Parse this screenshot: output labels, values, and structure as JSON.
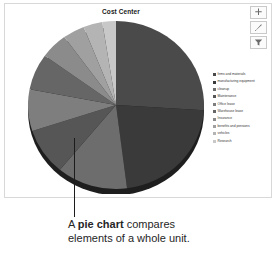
{
  "panel": {
    "title": "Cost Center"
  },
  "toolbar": {
    "buttons": [
      {
        "name": "add-button",
        "icon": "plus-icon",
        "label": "Add"
      },
      {
        "name": "edit-button",
        "icon": "pencil-icon",
        "label": "Edit"
      },
      {
        "name": "filter-button",
        "icon": "funnel-icon",
        "label": "Filter"
      }
    ]
  },
  "caption": {
    "lead": "A ",
    "emphasis": "pie chart",
    "rest": " compares",
    "line2": "elements of a whole unit."
  },
  "chart_data": {
    "type": "pie",
    "title": "Cost Center",
    "xlabel": "",
    "ylabel": "",
    "legend_position": "right",
    "grid": false,
    "categories": [
      "firms and materials",
      "manufacturing equipment",
      "cleanup",
      "Maintenance",
      "Office lease",
      "Warehouse lease",
      "Insurance",
      "benefits and pensions",
      "vehicles",
      "Research"
    ],
    "values": [
      26,
      22,
      13,
      9,
      8,
      7,
      5,
      4,
      3.5,
      2.5
    ],
    "colors": [
      "#4a4a4a",
      "#3a3a3a",
      "#6d6d6d",
      "#565656",
      "#7e7e7e",
      "#666666",
      "#8b8b8b",
      "#a0a0a0",
      "#b4b4b4",
      "#c8c8c8"
    ],
    "legend_swatch_colors": [
      "#4a4a4a",
      "#3a3a3a",
      "#6d6d6d",
      "#565656",
      "#7e7e7e",
      "#666666",
      "#8b8b8b",
      "#a0a0a0",
      "#b4b4b4",
      "#c8c8c8"
    ]
  }
}
